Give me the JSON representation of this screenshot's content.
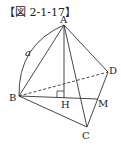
{
  "figure": {
    "title": "【図 2-1-17】",
    "points": {
      "A": {
        "label": "A",
        "x": 64,
        "y": 25
      },
      "B": {
        "label": "B",
        "x": 19,
        "y": 96
      },
      "C": {
        "label": "C",
        "x": 87,
        "y": 127
      },
      "D": {
        "label": "D",
        "x": 108,
        "y": 72
      },
      "H": {
        "label": "H",
        "x": 64,
        "y": 98
      },
      "M": {
        "label": "M",
        "x": 98,
        "y": 99
      }
    },
    "arc_label": "a",
    "line_color": "#333333",
    "segments": [
      {
        "from": "A",
        "to": "B",
        "style": "solid"
      },
      {
        "from": "A",
        "to": "C",
        "style": "solid"
      },
      {
        "from": "A",
        "to": "D",
        "style": "solid"
      },
      {
        "from": "A",
        "to": "H",
        "style": "solid"
      },
      {
        "from": "B",
        "to": "C",
        "style": "solid"
      },
      {
        "from": "B",
        "to": "M",
        "style": "solid"
      },
      {
        "from": "C",
        "to": "D",
        "style": "solid"
      },
      {
        "from": "B",
        "to": "D",
        "style": "dashed"
      }
    ],
    "right_angle_at": "H"
  }
}
